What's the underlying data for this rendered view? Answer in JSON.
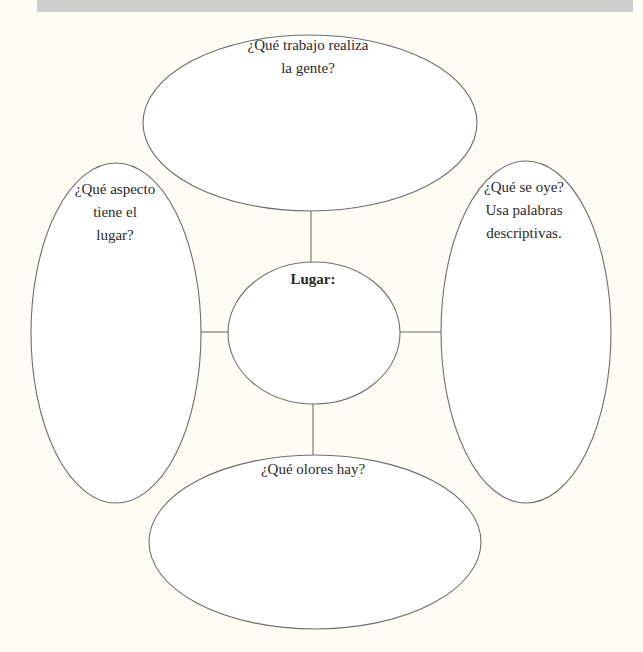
{
  "header": {
    "bar_color": "#cfcfcd"
  },
  "diagram": {
    "type": "graphic organizer / web diagram",
    "center": {
      "label": "Lugar:"
    },
    "nodes": {
      "top": {
        "lines": [
          "¿Qué trabajo realiza",
          "la gente?"
        ]
      },
      "left": {
        "lines": [
          "¿Qué aspecto",
          "tiene el",
          "lugar?"
        ]
      },
      "right": {
        "lines": [
          "¿Qué se oye?",
          "Usa palabras",
          "descriptivas."
        ]
      },
      "bottom": {
        "lines": [
          "¿Qué olores hay?"
        ]
      }
    },
    "colors": {
      "background": "#fdfcf5",
      "stroke": "#6e6e6e",
      "text": "#2a2a2a"
    }
  }
}
